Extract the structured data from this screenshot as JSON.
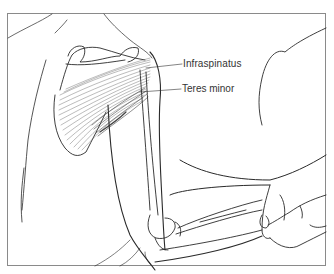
{
  "figure": {
    "labels": {
      "infraspinatus": "Infraspinatus",
      "teres_minor": "Teres minor"
    },
    "colors": {
      "line": "#2a2a2a",
      "muscle_fiber": "#6a6a6a",
      "frame": "#8a8a8a",
      "background": "#ffffff"
    }
  }
}
